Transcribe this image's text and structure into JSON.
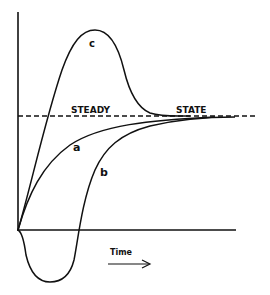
{
  "diagram": {
    "steady_state_label_left": "STEADY",
    "steady_state_label_right": "STATE",
    "x_axis_label": "Time",
    "curves": [
      {
        "id": "a",
        "label": "a",
        "description": "monotonic rise approaching steady state"
      },
      {
        "id": "b",
        "label": "b",
        "description": "initial dip below zero, then rise to steady state"
      },
      {
        "id": "c",
        "label": "c",
        "description": "overshoot peak above steady state, then decay to steady state"
      }
    ],
    "colors": {
      "line": "#111111",
      "background": "#ffffff"
    }
  }
}
